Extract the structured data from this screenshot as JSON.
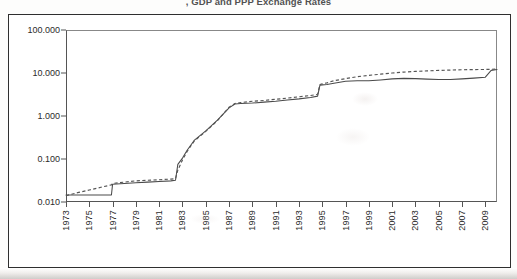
{
  "title": ", GDP and PPP Exchange Rates",
  "figure": {
    "background_color": "#ffffff",
    "border_color": "#2f2f2f",
    "line_color": "#4a4a4a"
  },
  "chart_data": {
    "type": "line",
    "title": ", GDP and PPP Exchange Rates",
    "xlabel": "",
    "ylabel": "",
    "yscale": "log",
    "ylim": [
      0.01,
      100
    ],
    "xlim": [
      1973,
      2010
    ],
    "grid": false,
    "legend": "none",
    "y_tick_labels": [
      "100.000",
      "10.000",
      "1.000",
      "0.100",
      "0.010"
    ],
    "y_tick_values": [
      100.0,
      10.0,
      1.0,
      0.1,
      0.01
    ],
    "x_tick_labels": [
      "1973",
      "1975",
      "1977",
      "1979",
      "1981",
      "1983",
      "1985",
      "1987",
      "1989",
      "1991",
      "1993",
      "1995",
      "1997",
      "1999",
      "2001",
      "2003",
      "2005",
      "2007",
      "2009"
    ],
    "x_tick_values": [
      1973,
      1975,
      1977,
      1979,
      1981,
      1983,
      1985,
      1987,
      1989,
      1991,
      1993,
      1995,
      1997,
      1999,
      2001,
      2003,
      2005,
      2007,
      2009
    ],
    "x": [
      1973,
      1974,
      1975,
      1976,
      1976.9,
      1977,
      1978,
      1979,
      1980,
      1981,
      1982,
      1982.4,
      1982.6,
      1983,
      1983.4,
      1984,
      1985,
      1986,
      1987,
      1987.5,
      1988,
      1989,
      1990,
      1991,
      1992,
      1993,
      1994,
      1994.6,
      1994.8,
      1995,
      1995.4,
      1996,
      1997,
      1998,
      1999,
      2000,
      2001,
      2002,
      2003,
      2004,
      2005,
      2006,
      2007,
      2008,
      2009,
      2009.5,
      2010
    ],
    "series": [
      {
        "name": "Official exchange rate",
        "style": "solid",
        "values": [
          0.0145,
          0.0145,
          0.0145,
          0.0145,
          0.0145,
          0.026,
          0.027,
          0.028,
          0.029,
          0.03,
          0.031,
          0.032,
          0.075,
          0.105,
          0.16,
          0.27,
          0.45,
          0.8,
          1.55,
          1.9,
          1.95,
          2.0,
          2.1,
          2.2,
          2.35,
          2.5,
          2.7,
          2.9,
          5.2,
          5.3,
          5.4,
          5.8,
          6.4,
          6.6,
          6.6,
          6.9,
          7.3,
          7.5,
          7.4,
          7.2,
          7.1,
          7.1,
          7.3,
          7.6,
          8.0,
          11.5,
          12.0
        ]
      },
      {
        "name": "PPP exchange rate",
        "style": "dashed",
        "values": [
          0.014,
          0.0165,
          0.019,
          0.022,
          0.025,
          0.027,
          0.029,
          0.031,
          0.032,
          0.033,
          0.034,
          0.035,
          0.055,
          0.095,
          0.15,
          0.26,
          0.44,
          0.78,
          1.6,
          1.95,
          2.05,
          2.2,
          2.3,
          2.45,
          2.6,
          2.8,
          3.0,
          3.2,
          5.4,
          5.6,
          5.9,
          6.6,
          7.4,
          8.2,
          8.8,
          9.4,
          10.0,
          10.5,
          10.9,
          11.2,
          11.5,
          11.7,
          11.9,
          12.0,
          12.1,
          12.2,
          12.3
        ]
      }
    ]
  }
}
